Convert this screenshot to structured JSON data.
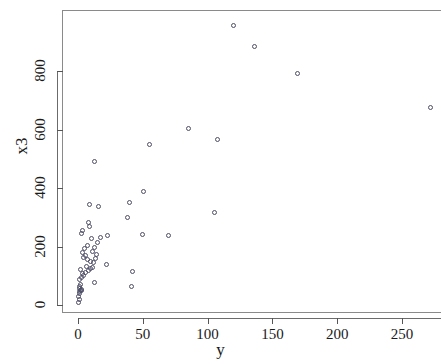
{
  "chart_data": {
    "type": "scatter",
    "title": "",
    "xlabel": "y",
    "ylabel": "x3",
    "xlim": [
      -8,
      280
    ],
    "ylim": [
      -30,
      1010
    ],
    "grid": false,
    "legend": null,
    "marker": "open-circle",
    "marker_color": "#4d4d66",
    "xticks": [
      0,
      50,
      100,
      150,
      200,
      250
    ],
    "yticks": [
      0,
      200,
      400,
      600,
      800
    ],
    "xtick_labels": [
      "0",
      "50",
      "100",
      "150",
      "200",
      "250"
    ],
    "ytick_labels": [
      "0",
      "200",
      "400",
      "600",
      "800"
    ],
    "points": [
      {
        "x": 0.5,
        "y": 8
      },
      {
        "x": 0.8,
        "y": 20
      },
      {
        "x": 0.6,
        "y": 30
      },
      {
        "x": 1.2,
        "y": 38
      },
      {
        "x": 1.0,
        "y": 45
      },
      {
        "x": 1.8,
        "y": 48
      },
      {
        "x": 2.4,
        "y": 50
      },
      {
        "x": 1.5,
        "y": 55
      },
      {
        "x": 3.0,
        "y": 52
      },
      {
        "x": 0.9,
        "y": 62
      },
      {
        "x": 2.0,
        "y": 70
      },
      {
        "x": 13.0,
        "y": 78
      },
      {
        "x": 1.4,
        "y": 88
      },
      {
        "x": 2.6,
        "y": 95
      },
      {
        "x": 4.5,
        "y": 100
      },
      {
        "x": 3.2,
        "y": 108
      },
      {
        "x": 5.5,
        "y": 112
      },
      {
        "x": 8.0,
        "y": 118
      },
      {
        "x": 2.2,
        "y": 122
      },
      {
        "x": 9.5,
        "y": 125
      },
      {
        "x": 11.0,
        "y": 128
      },
      {
        "x": 6.5,
        "y": 132
      },
      {
        "x": 41.0,
        "y": 62
      },
      {
        "x": 42.0,
        "y": 113
      },
      {
        "x": 22.0,
        "y": 140
      },
      {
        "x": 12.0,
        "y": 145
      },
      {
        "x": 10.0,
        "y": 150
      },
      {
        "x": 7.0,
        "y": 155
      },
      {
        "x": 13.5,
        "y": 158
      },
      {
        "x": 4.0,
        "y": 162
      },
      {
        "x": 6.0,
        "y": 168
      },
      {
        "x": 14.5,
        "y": 172
      },
      {
        "x": 3.5,
        "y": 178
      },
      {
        "x": 11.5,
        "y": 182
      },
      {
        "x": 5.0,
        "y": 192
      },
      {
        "x": 12.5,
        "y": 198
      },
      {
        "x": 7.5,
        "y": 205
      },
      {
        "x": 15.0,
        "y": 212
      },
      {
        "x": 10.5,
        "y": 228
      },
      {
        "x": 17.0,
        "y": 232
      },
      {
        "x": 22.5,
        "y": 238
      },
      {
        "x": 50.0,
        "y": 240
      },
      {
        "x": 70.0,
        "y": 238
      },
      {
        "x": 2.8,
        "y": 245
      },
      {
        "x": 3.8,
        "y": 255
      },
      {
        "x": 8.5,
        "y": 268
      },
      {
        "x": 8.2,
        "y": 282
      },
      {
        "x": 38.0,
        "y": 298
      },
      {
        "x": 105.0,
        "y": 315
      },
      {
        "x": 9.0,
        "y": 345
      },
      {
        "x": 40.0,
        "y": 350
      },
      {
        "x": 15.5,
        "y": 338
      },
      {
        "x": 50.5,
        "y": 388
      },
      {
        "x": 13.0,
        "y": 492
      },
      {
        "x": 55.0,
        "y": 548
      },
      {
        "x": 108.0,
        "y": 565
      },
      {
        "x": 85.0,
        "y": 605
      },
      {
        "x": 272.0,
        "y": 675
      },
      {
        "x": 169.0,
        "y": 790
      },
      {
        "x": 136.0,
        "y": 885
      },
      {
        "x": 120.0,
        "y": 955
      }
    ]
  },
  "axis": {
    "y_title": "x3",
    "x_title": "y"
  }
}
